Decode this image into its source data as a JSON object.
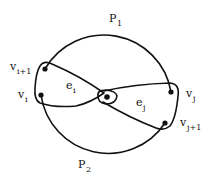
{
  "diagram": {
    "type": "hypergraph-cycle",
    "paths": [
      {
        "id": "P1",
        "label": "P",
        "subscript": "1",
        "position": "top"
      },
      {
        "id": "P2",
        "label": "P",
        "subscript": "2",
        "position": "bottom"
      }
    ],
    "vertices": [
      {
        "id": "v_i+1",
        "label": "v",
        "subscript": "i+1"
      },
      {
        "id": "v_i",
        "label": "v",
        "subscript": "i"
      },
      {
        "id": "v_j",
        "label": "v",
        "subscript": "j"
      },
      {
        "id": "v_j+1",
        "label": "v",
        "subscript": "j+1"
      },
      {
        "id": "center",
        "label": "",
        "subscript": ""
      }
    ],
    "edges": [
      {
        "id": "e_i",
        "label": "e",
        "subscript": "i",
        "contains": [
          "v_i+1",
          "v_i",
          "center"
        ]
      },
      {
        "id": "e_j",
        "label": "e",
        "subscript": "j",
        "contains": [
          "v_j",
          "v_j+1",
          "center"
        ]
      }
    ],
    "colors": {
      "ink": "#111111",
      "background": "#ffffff"
    }
  }
}
